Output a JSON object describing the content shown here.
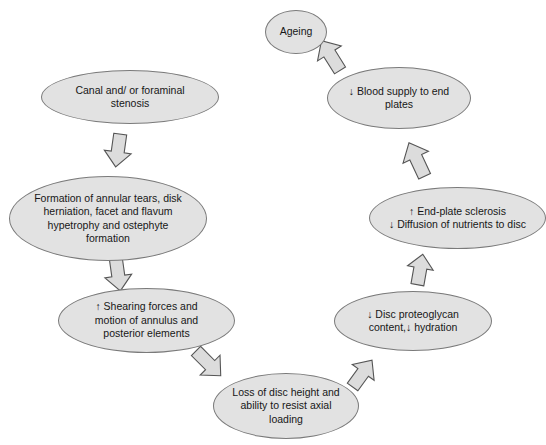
{
  "diagram": {
    "type": "cycle-flowchart",
    "background_color": "#ffffff",
    "node_fill_color": "#e2e2e2",
    "node_border_color": "#7a7a7a",
    "arrow_fill_color": "#dcdcdc",
    "arrow_border_color": "#555555",
    "nodes": [
      {
        "id": "ageing",
        "label": "Ageing",
        "x": 265,
        "y": 10,
        "w": 62,
        "h": 44,
        "font_size": 10.5
      },
      {
        "id": "blood-supply",
        "label": "↓ Blood supply to end plates",
        "line1": "↓ Blood supply to end",
        "line2": "plates",
        "x": 327,
        "y": 67,
        "w": 144,
        "h": 62,
        "font_size": 10.5
      },
      {
        "id": "end-plate-sclerosis",
        "label": "↑ End-plate sclerosis ↓ Diffusion of nutrients to disc",
        "line1": "↑  End-plate sclerosis",
        "line2": "↓ Diffusion of nutrients to disc",
        "x": 369,
        "y": 187,
        "w": 177,
        "h": 62,
        "font_size": 10.5
      },
      {
        "id": "proteoglycan",
        "label": "↓ Disc proteoglycan content, ↓ hydration",
        "line1": "↓ Disc proteoglycan",
        "line2": "content,↓ hydration",
        "x": 334,
        "y": 291,
        "w": 158,
        "h": 60,
        "font_size": 10.5
      },
      {
        "id": "disc-height",
        "label": "Loss of disc height and ability to resist axial loading",
        "line1": "Loss of disc height and",
        "line2": "ability to resist axial",
        "line3": "loading",
        "x": 213,
        "y": 373,
        "w": 146,
        "h": 66,
        "font_size": 10.5
      },
      {
        "id": "shearing-forces",
        "label": "↑ Shearing forces and motion of annulus and posterior elements",
        "line1": "↑ Shearing forces and",
        "line2": "motion of annulus and",
        "line3": "posterior elements",
        "x": 58,
        "y": 288,
        "w": 177,
        "h": 65,
        "font_size": 10.5
      },
      {
        "id": "annular-tears",
        "label": "Formation of annular tears, disk herniation, facet and flavum hypetrophy and ostephyte formation",
        "line1": "Formation of annular tears, disk",
        "line2": "herniation, facet and flavum",
        "line3": "hypetrophy and ostephyte",
        "line4": "formation",
        "x": 9,
        "y": 176,
        "w": 198,
        "h": 85,
        "font_size": 10.5
      },
      {
        "id": "stenosis",
        "label": "Canal and/ or foraminal stenosis",
        "line1": "Canal and/ or foraminal",
        "line2": "stenosis",
        "x": 41,
        "y": 70,
        "w": 178,
        "h": 54,
        "font_size": 10.5
      }
    ],
    "arrows": [
      {
        "id": "arrow-ageing-to-blood",
        "from": "ageing",
        "to": "blood-supply",
        "cx": 331,
        "cy": 56,
        "rotation": 148
      },
      {
        "id": "arrow-blood-to-sclerosis",
        "from": "blood-supply",
        "to": "end-plate-sclerosis",
        "cx": 417,
        "cy": 160,
        "rotation": 155
      },
      {
        "id": "arrow-sclerosis-to-proteoglycan",
        "from": "end-plate-sclerosis",
        "to": "proteoglycan",
        "cx": 420,
        "cy": 270,
        "rotation": 190
      },
      {
        "id": "arrow-proteoglycan-to-height",
        "from": "proteoglycan",
        "to": "disc-height",
        "cx": 362,
        "cy": 374,
        "rotation": 216
      },
      {
        "id": "arrow-height-to-shearing",
        "from": "disc-height",
        "to": "shearing-forces",
        "cx": 208,
        "cy": 363,
        "rotation": 315
      },
      {
        "id": "arrow-shearing-to-tears",
        "from": "shearing-forces",
        "to": "annular-tears",
        "cx": 118,
        "cy": 274,
        "rotation": 352
      },
      {
        "id": "arrow-tears-to-stenosis",
        "from": "annular-tears",
        "to": "stenosis",
        "cx": 118,
        "cy": 150,
        "rotation": 8
      }
    ]
  }
}
